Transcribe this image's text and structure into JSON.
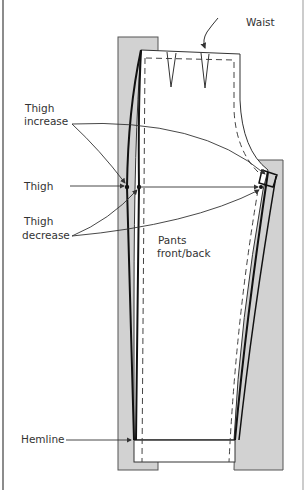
{
  "diagram": {
    "labels": {
      "waist": "Waist",
      "thigh_increase_1": "Thigh",
      "thigh_increase_2": "increase",
      "thigh": "Thigh",
      "thigh_decrease_1": "Thigh",
      "thigh_decrease_2": "decrease",
      "pattern_1": "Pants",
      "pattern_2": "front/back",
      "hemline": "Hemline"
    },
    "colors": {
      "line": "#222222",
      "shade": "#cfcfcf",
      "shade_border": "#555555",
      "frame": "#666666"
    }
  }
}
